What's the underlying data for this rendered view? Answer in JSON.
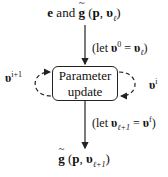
{
  "diagram": {
    "top_label": {
      "prefix": "e",
      "connector": " and ",
      "func": "g",
      "args_open": " (",
      "p": "p",
      "sep": ", ",
      "v": "υ",
      "v_sub": "ℓ",
      "args_close": ")"
    },
    "let_top": {
      "open": "(let ",
      "v": "υ",
      "sup": "0",
      "eq": " = ",
      "v2": "υ",
      "sub2": "ℓ",
      "close": ")"
    },
    "box": {
      "line1": "Parameter",
      "line2": "update"
    },
    "left_loop": {
      "v": "υ",
      "sup": "i+1"
    },
    "right_loop": {
      "v": "υ",
      "sup": "i"
    },
    "let_bottom": {
      "open": "(let ",
      "v": "υ",
      "sub": "ℓ+1",
      "eq": " = ",
      "v2": "υ",
      "sup2": "f",
      "close": ")"
    },
    "bottom_label": {
      "func": "g",
      "args_open": " (",
      "p": "p",
      "sep": ", ",
      "v": "υ",
      "v_sub": "ℓ+1",
      "args_close": ")"
    }
  }
}
